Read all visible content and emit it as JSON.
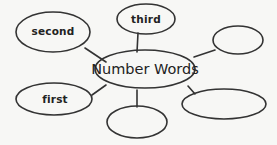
{
  "diagram": {
    "type": "concept-web",
    "center": {
      "label": "Number Words"
    },
    "nodes": [
      {
        "id": "second",
        "label": "second",
        "filled": true
      },
      {
        "id": "third",
        "label": "third",
        "filled": true
      },
      {
        "id": "first",
        "label": "first",
        "filled": true
      },
      {
        "id": "blank-top-right",
        "label": "",
        "filled": false
      },
      {
        "id": "blank-bottom-middle",
        "label": "",
        "filled": false
      },
      {
        "id": "blank-bottom-right",
        "label": "",
        "filled": false
      }
    ],
    "colors": {
      "stroke": "#333333",
      "background": "#f7f7f5",
      "text": "#222222"
    }
  }
}
